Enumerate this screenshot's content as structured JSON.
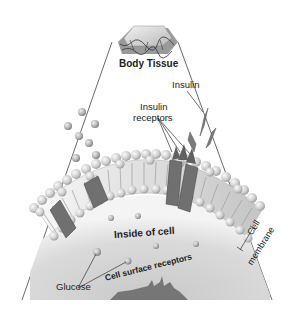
{
  "diagram": {
    "labels": {
      "body_tissue": "Body Tissue",
      "insulin": "Insulin",
      "insulin_receptors_line1": "Insulin",
      "insulin_receptors_line2": "receptors",
      "inside_of_cell": "Inside of cell",
      "cell_membrane_line1": "Cell",
      "cell_membrane_line2": "membrane",
      "glucose": "Glucose",
      "cell_surface_receptors": "Cell surface receptors"
    },
    "colors": {
      "background": "#ffffff",
      "phospholipid_head": "#d8d8d8",
      "protein_channel": "#6e6e6e",
      "insulin": "#777777",
      "cytoplasm": "#cfcfcf",
      "nucleus": "#777777",
      "line": "#444444"
    },
    "elements": [
      {
        "name": "body-tissue-block",
        "type": "illustration"
      },
      {
        "name": "cell-membrane-arc",
        "type": "phospholipid bilayer"
      },
      {
        "name": "protein-channels",
        "count": 4
      },
      {
        "name": "insulin-molecules",
        "count": 3
      },
      {
        "name": "glucose-molecules-outside",
        "count": 6
      },
      {
        "name": "glucose-molecules-inside",
        "count": 5
      },
      {
        "name": "nucleus",
        "type": "irregular shape"
      }
    ]
  }
}
